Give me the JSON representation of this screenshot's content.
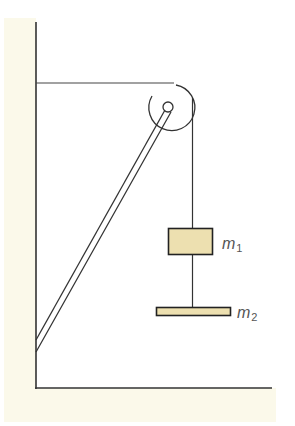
{
  "diagram": {
    "type": "physics-pulley-system",
    "colors": {
      "background": "#ffffff",
      "surface": "#fbf9ea",
      "mass_fill": "#ede0b0",
      "line": "#333333",
      "label": "#555555"
    },
    "labels": {
      "m1": {
        "base": "m",
        "sub": "1"
      },
      "m2": {
        "base": "m",
        "sub": "2"
      }
    }
  }
}
